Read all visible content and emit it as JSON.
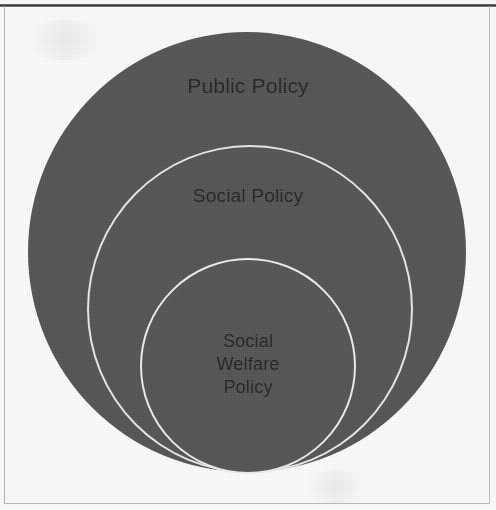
{
  "diagram": {
    "type": "nested-circles",
    "fill_color": "#555555",
    "outline_color": "#ebebeb",
    "text_color": "#242424",
    "background_color": "#fdfdfd",
    "frame_color": "#b9b9b9",
    "levels": [
      {
        "id": "public-policy",
        "label": "Public Policy",
        "rank": 1,
        "scope": "outermost",
        "center": "247,252",
        "diameter_px": 438
      },
      {
        "id": "social-policy",
        "label": "Social Policy",
        "rank": 2,
        "scope": "middle",
        "center": "250,309",
        "diameter_px": 326
      },
      {
        "id": "social-welfare-policy",
        "label": "Social\nWelfare\nPolicy",
        "rank": 3,
        "scope": "innermost",
        "center": "248,366",
        "diameter_px": 216
      }
    ]
  }
}
